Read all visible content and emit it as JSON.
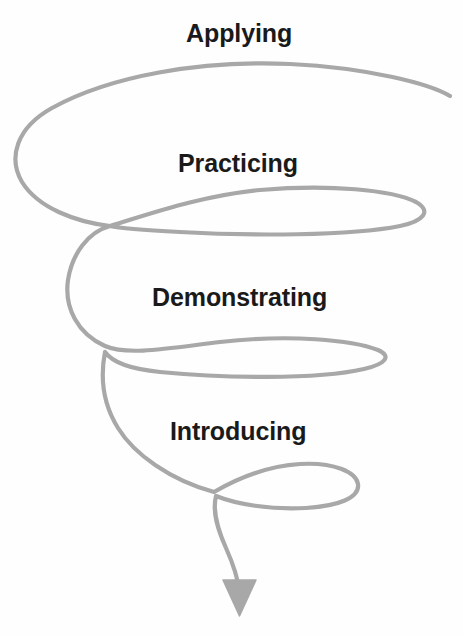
{
  "diagram": {
    "type": "spiral-process-diagram",
    "background_color": "#ffffff",
    "curve_color": "#a8a8a8",
    "label_color": "#1a1a1a",
    "direction": "downward",
    "arrow": {
      "name": "downward-arrowhead",
      "color": "#a8a8a8",
      "tip_x": 239,
      "tip_y": 616
    },
    "stages": [
      {
        "label": "Applying",
        "order": 1,
        "loop_index": 1,
        "loop_size": "largest"
      },
      {
        "label": "Practicing",
        "order": 2,
        "loop_index": 2,
        "loop_size": "large"
      },
      {
        "label": "Demonstrating",
        "order": 3,
        "loop_index": 3,
        "loop_size": "medium"
      },
      {
        "label": "Introducing",
        "order": 4,
        "loop_index": 4,
        "loop_size": "smallest"
      }
    ]
  }
}
